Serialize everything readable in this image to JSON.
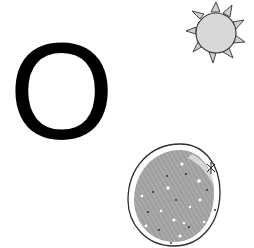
{
  "card": {
    "letter": "O",
    "illustrations": [
      {
        "name": "sun-icon",
        "description": "hand-drawn sun with gray shaded disc and triangular rays"
      },
      {
        "name": "moon-icon",
        "description": "hand-drawn egg-shaped gray celestial body with dots and a small star"
      }
    ],
    "colors": {
      "letter": "#000000",
      "background": "#ffffff",
      "fill_light": "#d9d9d9",
      "fill_dark": "#9a9a9a",
      "outline": "#333333"
    }
  }
}
